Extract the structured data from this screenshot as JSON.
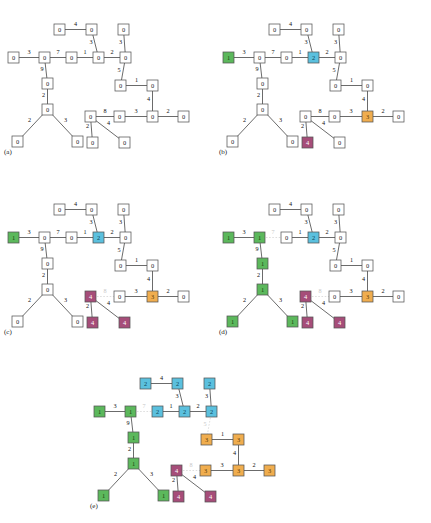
{
  "figure": {
    "type": "graph-coloring-progression",
    "node_size": 11,
    "colors": {
      "uncolored_fill": "#ffffff",
      "uncolored_text": "#222222",
      "c1_fill": "#5cb85c",
      "c1_stroke": "#3f8f3f",
      "c1_text": "#17400f",
      "c2_fill": "#5bc0de",
      "c2_stroke": "#3a9ec0",
      "c2_text": "#0d4758",
      "c3_fill": "#f0ad4e",
      "c3_stroke": "#d08d2a",
      "c3_text": "#5a3a05",
      "c4_fill": "#a64d79",
      "c4_stroke": "#7e345b",
      "c4_text": "#ffffff",
      "edge": "#3a3a3a",
      "edge_cut": "#d0d0d0",
      "background": "#ffffff"
    },
    "legend": {
      "c1_label": "1",
      "c2_label": "2",
      "c3_label": "3",
      "c4_label": "4",
      "zero_label": "0"
    }
  },
  "nodes_layout": {
    "n_topA": {
      "x": 52,
      "y": 16
    },
    "n_topB": {
      "x": 84,
      "y": 16
    },
    "n_topC": {
      "x": 116,
      "y": 16
    },
    "n_l0": {
      "x": 6,
      "y": 44
    },
    "n_l1": {
      "x": 37,
      "y": 44
    },
    "n_l2": {
      "x": 64,
      "y": 44
    },
    "n_l3": {
      "x": 91,
      "y": 44
    },
    "n_r1": {
      "x": 118,
      "y": 44
    },
    "n_m1": {
      "x": 40,
      "y": 70
    },
    "n_m2": {
      "x": 40,
      "y": 96
    },
    "n_lf1": {
      "x": 10,
      "y": 128
    },
    "n_lf2": {
      "x": 70,
      "y": 128
    },
    "n_s1": {
      "x": 113,
      "y": 72
    },
    "n_s2": {
      "x": 145,
      "y": 72
    },
    "n_b0": {
      "x": 83,
      "y": 103
    },
    "n_b1": {
      "x": 112,
      "y": 103
    },
    "n_b2": {
      "x": 145,
      "y": 103
    },
    "n_b3": {
      "x": 176,
      "y": 103
    },
    "n_bf1": {
      "x": 85,
      "y": 129
    },
    "n_bf2": {
      "x": 117,
      "y": 129
    }
  },
  "edges": [
    {
      "id": "e_topA_topB",
      "w": "4"
    },
    {
      "id": "e_topB_l3",
      "w": "3"
    },
    {
      "id": "e_topC_r1",
      "w": "3"
    },
    {
      "id": "e_l0_l1",
      "w": "3"
    },
    {
      "id": "e_l1_l2",
      "w": "7"
    },
    {
      "id": "e_l2_l3",
      "w": "1"
    },
    {
      "id": "e_l3_r1",
      "w": "2"
    },
    {
      "id": "e_l1_m1",
      "w": "9"
    },
    {
      "id": "e_m1_m2",
      "w": "2"
    },
    {
      "id": "e_m2_lf1",
      "w": "2"
    },
    {
      "id": "e_m2_lf2",
      "w": "3"
    },
    {
      "id": "e_r1_s1",
      "w": "5"
    },
    {
      "id": "e_s1_s2",
      "w": "1"
    },
    {
      "id": "e_s2_b2",
      "w": "4"
    },
    {
      "id": "e_b0_b1",
      "w": "8"
    },
    {
      "id": "e_b1_b2",
      "w": "3"
    },
    {
      "id": "e_b2_b3",
      "w": "2"
    },
    {
      "id": "e_b0_bf1",
      "w": "2"
    },
    {
      "id": "e_b0_bf2",
      "w": "4"
    }
  ],
  "panels": [
    {
      "id": "a",
      "caption": "(a)",
      "values": {
        "n_topA": "0",
        "n_topB": "0",
        "n_topC": "0",
        "n_l0": "0",
        "n_l1": "0",
        "n_l2": "0",
        "n_l3": "0",
        "n_r1": "0",
        "n_m1": "0",
        "n_m2": "0",
        "n_lf1": "0",
        "n_lf2": "0",
        "n_s1": "0",
        "n_s2": "0",
        "n_b0": "0",
        "n_b1": "0",
        "n_b2": "0",
        "n_b3": "0",
        "n_bf1": "0",
        "n_bf2": "0"
      },
      "classes": {
        "n_topA": "c0",
        "n_topB": "c0",
        "n_topC": "c0",
        "n_l0": "c0",
        "n_l1": "c0",
        "n_l2": "c0",
        "n_l3": "c0",
        "n_r1": "c0",
        "n_m1": "c0",
        "n_m2": "c0",
        "n_lf1": "c0",
        "n_lf2": "c0",
        "n_s1": "c0",
        "n_s2": "c0",
        "n_b0": "c0",
        "n_b1": "c0",
        "n_b2": "c0",
        "n_b3": "c0",
        "n_bf1": "c0",
        "n_bf2": "c0"
      },
      "cut_edges": []
    },
    {
      "id": "b",
      "caption": "(b)",
      "values": {
        "n_topA": "0",
        "n_topB": "0",
        "n_topC": "0",
        "n_l0": "1",
        "n_l1": "0",
        "n_l2": "0",
        "n_l3": "2",
        "n_r1": "0",
        "n_m1": "0",
        "n_m2": "0",
        "n_lf1": "0",
        "n_lf2": "0",
        "n_s1": "0",
        "n_s2": "0",
        "n_b0": "0",
        "n_b1": "0",
        "n_b2": "3",
        "n_b3": "0",
        "n_bf1": "4",
        "n_bf2": "0"
      },
      "classes": {
        "n_topA": "c0",
        "n_topB": "c0",
        "n_topC": "c0",
        "n_l0": "c1",
        "n_l1": "c0",
        "n_l2": "c0",
        "n_l3": "c2",
        "n_r1": "c0",
        "n_m1": "c0",
        "n_m2": "c0",
        "n_lf1": "c0",
        "n_lf2": "c0",
        "n_s1": "c0",
        "n_s2": "c0",
        "n_b0": "c0",
        "n_b1": "c0",
        "n_b2": "c3",
        "n_b3": "c0",
        "n_bf1": "c4",
        "n_bf2": "c0"
      },
      "cut_edges": []
    },
    {
      "id": "c",
      "caption": "(c)",
      "values": {
        "n_topA": "0",
        "n_topB": "0",
        "n_topC": "0",
        "n_l0": "1",
        "n_l1": "0",
        "n_l2": "0",
        "n_l3": "2",
        "n_r1": "0",
        "n_m1": "0",
        "n_m2": "0",
        "n_lf1": "0",
        "n_lf2": "0",
        "n_s1": "0",
        "n_s2": "0",
        "n_b0": "4",
        "n_b1": "0",
        "n_b2": "3",
        "n_b3": "0",
        "n_bf1": "4",
        "n_bf2": "4"
      },
      "classes": {
        "n_topA": "c0",
        "n_topB": "c0",
        "n_topC": "c0",
        "n_l0": "c1",
        "n_l1": "c0",
        "n_l2": "c0",
        "n_l3": "c2",
        "n_r1": "c0",
        "n_m1": "c0",
        "n_m2": "c0",
        "n_lf1": "c0",
        "n_lf2": "c0",
        "n_s1": "c0",
        "n_s2": "c0",
        "n_b0": "c4",
        "n_b1": "c0",
        "n_b2": "c3",
        "n_b3": "c0",
        "n_bf1": "c4",
        "n_bf2": "c4"
      },
      "cut_edges": [
        "e_b0_b1"
      ]
    },
    {
      "id": "d",
      "caption": "(d)",
      "values": {
        "n_topA": "0",
        "n_topB": "0",
        "n_topC": "0",
        "n_l0": "1",
        "n_l1": "1",
        "n_l2": "0",
        "n_l3": "2",
        "n_r1": "0",
        "n_m1": "1",
        "n_m2": "1",
        "n_lf1": "1",
        "n_lf2": "1",
        "n_s1": "0",
        "n_s2": "0",
        "n_b0": "4",
        "n_b1": "0",
        "n_b2": "3",
        "n_b3": "0",
        "n_bf1": "4",
        "n_bf2": "4"
      },
      "classes": {
        "n_topA": "c0",
        "n_topB": "c0",
        "n_topC": "c0",
        "n_l0": "c1",
        "n_l1": "c1",
        "n_l2": "c0",
        "n_l3": "c2",
        "n_r1": "c0",
        "n_m1": "c1",
        "n_m2": "c1",
        "n_lf1": "c1",
        "n_lf2": "c1",
        "n_s1": "c0",
        "n_s2": "c0",
        "n_b0": "c4",
        "n_b1": "c0",
        "n_b2": "c3",
        "n_b3": "c0",
        "n_bf1": "c4",
        "n_bf2": "c4"
      },
      "cut_edges": [
        "e_b0_b1",
        "e_l1_l2"
      ]
    },
    {
      "id": "e",
      "caption": "(e)",
      "values": {
        "n_topA": "2",
        "n_topB": "2",
        "n_topC": "2",
        "n_l0": "1",
        "n_l1": "1",
        "n_l2": "2",
        "n_l3": "2",
        "n_r1": "2",
        "n_m1": "1",
        "n_m2": "1",
        "n_lf1": "1",
        "n_lf2": "1",
        "n_s1": "3",
        "n_s2": "3",
        "n_b0": "4",
        "n_b1": "3",
        "n_b2": "3",
        "n_b3": "3",
        "n_bf1": "4",
        "n_bf2": "4"
      },
      "classes": {
        "n_topA": "c2",
        "n_topB": "c2",
        "n_topC": "c2",
        "n_l0": "c1",
        "n_l1": "c1",
        "n_l2": "c2",
        "n_l3": "c2",
        "n_r1": "c2",
        "n_m1": "c1",
        "n_m2": "c1",
        "n_lf1": "c1",
        "n_lf2": "c1",
        "n_s1": "c3",
        "n_s2": "c3",
        "n_b0": "c4",
        "n_b1": "c3",
        "n_b2": "c3",
        "n_b3": "c3",
        "n_bf1": "c4",
        "n_bf2": "c4"
      },
      "cut_edges": [
        "e_b0_b1",
        "e_l1_l2",
        "e_r1_s1"
      ]
    }
  ],
  "panel_positions": {
    "a": {
      "left": 2,
      "top": 8
    },
    "b": {
      "left": 217,
      "top": 8
    },
    "c": {
      "left": 2,
      "top": 188
    },
    "d": {
      "left": 217,
      "top": 188
    },
    "e": {
      "left": 88,
      "top": 362
    }
  }
}
